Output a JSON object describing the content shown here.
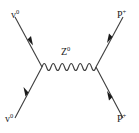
{
  "diagram": {
    "type": "feynman-diagram",
    "background_color": "#ffffff",
    "line_color": "#3d3d3d",
    "label_color": "#1a1a1a",
    "labels": {
      "incoming_left": {
        "symbol": "v",
        "charge": "0",
        "name": "neutrino-incoming"
      },
      "outgoing_left": {
        "symbol": "v",
        "charge": "0",
        "name": "neutrino-outgoing"
      },
      "incoming_right": {
        "symbol": "P",
        "charge": "+",
        "name": "proton-incoming"
      },
      "outgoing_right": {
        "symbol": "P",
        "charge": "+",
        "name": "proton-outgoing"
      },
      "propagator": {
        "symbol": "Z",
        "charge": "0",
        "name": "z-boson"
      }
    },
    "vertices": {
      "left": {
        "x": 42,
        "y": 67
      },
      "right": {
        "x": 96,
        "y": 67
      }
    },
    "legs": [
      {
        "name": "upper-left-leg",
        "x1": 15,
        "y1": 17,
        "x2": 42,
        "y2": 67,
        "arrow_t": 0.45,
        "arrow_dir": "toward-vertex"
      },
      {
        "name": "lower-left-leg",
        "x1": 42,
        "y1": 67,
        "x2": 15,
        "y2": 118,
        "arrow_t": 0.55,
        "arrow_dir": "toward-vertex"
      },
      {
        "name": "upper-right-leg",
        "x1": 96,
        "y1": 67,
        "x2": 123,
        "y2": 17,
        "arrow_t": 0.55,
        "arrow_dir": "away-from-vertex"
      },
      {
        "name": "lower-right-leg",
        "x1": 96,
        "y1": 67,
        "x2": 123,
        "y2": 118,
        "arrow_t": 0.55,
        "arrow_dir": "away-from-vertex"
      }
    ],
    "propagator_wave": {
      "cycles": 6,
      "amplitude": 4,
      "x_start": 42,
      "x_end": 96,
      "y": 67
    }
  }
}
